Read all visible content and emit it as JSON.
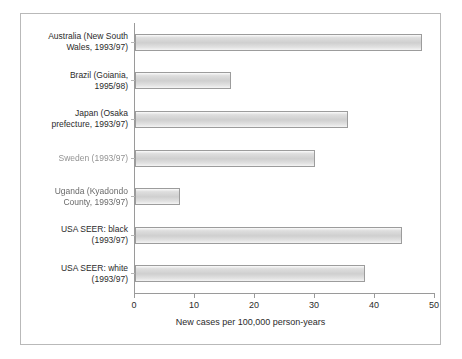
{
  "chart_data": {
    "type": "bar",
    "orientation": "horizontal",
    "title": "",
    "subtitle": "",
    "xlabel": "New cases per 100,000 person-years",
    "ylabel": "",
    "xlim": [
      0,
      50
    ],
    "xticks": [
      0,
      10,
      20,
      30,
      40,
      50
    ],
    "xtick_labels": [
      "0",
      "10",
      "20",
      "30",
      "40",
      "50"
    ],
    "grid": false,
    "legend": null,
    "categories": [
      "Australia (New South Wales, 1993/97)",
      "Brazil (Goiania, 1995/98)",
      "Japan (Osaka prefecture, 1993/97)",
      "Sweden (1993/97)",
      "Uganda (Kyadondo County, 1993/97)",
      "USA SEER: black (1993/97)",
      "USA SEER: white (1993/97)"
    ],
    "category_labels_wrapped": [
      "Australia (New South\nWales, 1993/97)",
      "Brazil (Goiania,\n1995/98)",
      "Japan (Osaka\nprefecture, 1993/97)",
      "Sweden (1993/97)",
      "Uganda (Kyadondo\nCounty, 1993/97)",
      "USA SEER: black\n(1993/97)",
      "USA SEER: white\n(1993/97)"
    ],
    "values": [
      47.8,
      16.0,
      35.5,
      30.0,
      7.5,
      44.5,
      38.3
    ],
    "bar_fill": "#d4d4d4",
    "bar_border": "#9c9c9c",
    "axis_color": "#9a9a9a",
    "frame_color": "#b9b9b9",
    "text_color": "#2b2b2b",
    "background": "#ffffff"
  }
}
